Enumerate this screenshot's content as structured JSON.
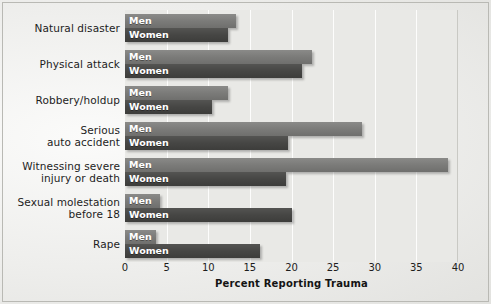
{
  "chart_data": {
    "type": "bar",
    "orientation": "horizontal",
    "title": "",
    "xlabel": "Percent Reporting Trauma",
    "ylabel": "",
    "xlim": [
      0,
      40
    ],
    "xticks": [
      0,
      5,
      10,
      15,
      20,
      25,
      30,
      35,
      40
    ],
    "grid": "vertical-only",
    "legend": "inline-bar-labels",
    "categories": [
      "Natural disaster",
      "Physical attack",
      "Robbery/holdup",
      "Serious auto accident",
      "Witnessing severe injury or death",
      "Sexual molestation before 18",
      "Rape"
    ],
    "category_lines": [
      [
        "Natural disaster"
      ],
      [
        "Physical attack"
      ],
      [
        "Robbery/holdup"
      ],
      [
        "Serious",
        "auto accident"
      ],
      [
        "Witnessing severe",
        "injury or death"
      ],
      [
        "Sexual molestation",
        "before 18"
      ],
      [
        "Rape"
      ]
    ],
    "series": [
      {
        "name": "Men",
        "color": "#7b7b79",
        "values": [
          13.3,
          22.5,
          12.4,
          28.5,
          38.8,
          4.2,
          3.7
        ]
      },
      {
        "name": "Women",
        "color": "#464644",
        "values": [
          12.4,
          21.3,
          10.5,
          19.6,
          19.3,
          20.0,
          16.2
        ]
      }
    ]
  }
}
